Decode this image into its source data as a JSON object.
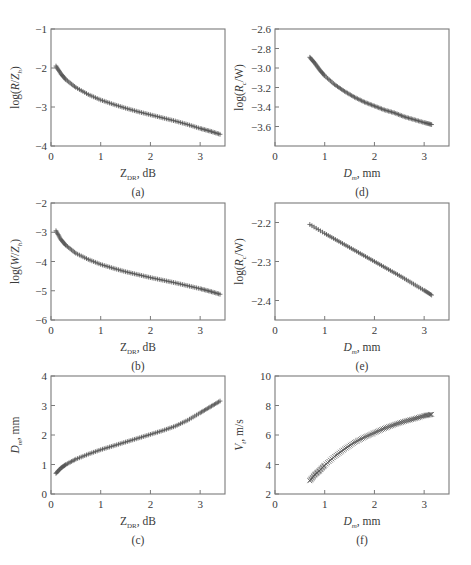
{
  "figure": {
    "panels": [
      "a",
      "b",
      "c",
      "d",
      "e",
      "f"
    ]
  },
  "chart_data": [
    {
      "id": "a",
      "type": "scatter",
      "caption": "(a)",
      "xlabel": "Z_DR, dB",
      "xlabel_main": "Z",
      "xlabel_sub": "DR",
      "xlabel_tail": ", dB",
      "ylabel": "log(R/Z_h)",
      "ylabel_parts": [
        "log(",
        "R",
        "/",
        "Z",
        "h",
        ")"
      ],
      "xlim": [
        0,
        3.5
      ],
      "ylim": [
        -4,
        -1
      ],
      "xticks": [
        0,
        1,
        2,
        3
      ],
      "yticks": [
        -1,
        -2,
        -3,
        -4
      ],
      "grid": false,
      "marker": "+",
      "frame": {
        "x": 51,
        "y": 29,
        "w": 174,
        "h": 117
      },
      "x": [
        0.1,
        0.2,
        0.3,
        0.5,
        0.75,
        1.0,
        1.25,
        1.5,
        1.75,
        2.0,
        2.25,
        2.5,
        2.75,
        3.0,
        3.2,
        3.4
      ],
      "y": [
        -1.95,
        -2.15,
        -2.3,
        -2.5,
        -2.68,
        -2.82,
        -2.93,
        -3.03,
        -3.12,
        -3.2,
        -3.28,
        -3.36,
        -3.45,
        -3.55,
        -3.62,
        -3.7
      ]
    },
    {
      "id": "b",
      "type": "scatter",
      "caption": "(b)",
      "xlabel": "Z_DR, dB",
      "xlabel_main": "Z",
      "xlabel_sub": "DR",
      "xlabel_tail": ", dB",
      "ylabel": "log(W/Z_h)",
      "ylabel_parts": [
        "log(",
        "W",
        "/",
        "Z",
        "h",
        ")"
      ],
      "xlim": [
        0,
        3.5
      ],
      "ylim": [
        -6,
        -2
      ],
      "xticks": [
        0,
        1,
        2,
        3
      ],
      "yticks": [
        -2,
        -3,
        -4,
        -5,
        -6
      ],
      "grid": false,
      "marker": "+",
      "frame": {
        "x": 51,
        "y": 203,
        "w": 174,
        "h": 117
      },
      "x": [
        0.1,
        0.2,
        0.3,
        0.5,
        0.75,
        1.0,
        1.25,
        1.5,
        1.75,
        2.0,
        2.25,
        2.5,
        2.75,
        3.0,
        3.2,
        3.4
      ],
      "y": [
        -2.95,
        -3.25,
        -3.45,
        -3.72,
        -3.93,
        -4.1,
        -4.23,
        -4.35,
        -4.45,
        -4.55,
        -4.64,
        -4.73,
        -4.83,
        -4.93,
        -5.02,
        -5.12
      ]
    },
    {
      "id": "c",
      "type": "scatter",
      "caption": "(c)",
      "xlabel": "Z_DR, dB",
      "xlabel_main": "Z",
      "xlabel_sub": "DR",
      "xlabel_tail": ", dB",
      "ylabel": "D_m, mm",
      "ylabel_parts": [
        "",
        "D",
        "",
        "",
        "m",
        ", mm"
      ],
      "xlim": [
        0,
        3.5
      ],
      "ylim": [
        0,
        4
      ],
      "xticks": [
        0,
        1,
        2,
        3
      ],
      "yticks": [
        0,
        1,
        2,
        3,
        4
      ],
      "grid": false,
      "marker": "+",
      "frame": {
        "x": 51,
        "y": 376,
        "w": 174,
        "h": 118
      },
      "x": [
        0.1,
        0.2,
        0.3,
        0.5,
        0.75,
        1.0,
        1.25,
        1.5,
        1.75,
        2.0,
        2.25,
        2.5,
        2.75,
        3.0,
        3.2,
        3.4
      ],
      "y": [
        0.7,
        0.88,
        1.0,
        1.18,
        1.35,
        1.5,
        1.63,
        1.76,
        1.89,
        2.02,
        2.15,
        2.3,
        2.5,
        2.75,
        2.95,
        3.15
      ]
    },
    {
      "id": "d",
      "type": "scatter",
      "caption": "(d)",
      "xlabel": "D_m, mm",
      "xlabel_main": "D",
      "xlabel_sub": "m",
      "xlabel_tail": ", mm",
      "ylabel": "log(R_c/W)",
      "ylabel_parts": [
        "log(",
        "R",
        "",
        "",
        "c",
        "/W)"
      ],
      "xlim": [
        0,
        3.5
      ],
      "ylim": [
        -3.8,
        -2.6
      ],
      "xticks": [
        0,
        1,
        2,
        3
      ],
      "yticks": [
        -2.6,
        -2.8,
        -3.0,
        -3.2,
        -3.4,
        -3.6
      ],
      "ytick_labels": [
        "-2.6",
        "-2.8",
        "-3.0",
        "-3.2",
        "-3.4",
        "-3.6"
      ],
      "grid": false,
      "marker": "+",
      "frame": {
        "x": 275,
        "y": 29,
        "w": 174,
        "h": 117
      },
      "x": [
        0.7,
        0.8,
        0.9,
        1.0,
        1.2,
        1.4,
        1.6,
        1.8,
        2.0,
        2.2,
        2.4,
        2.6,
        2.8,
        3.0,
        3.15
      ],
      "y": [
        -2.89,
        -2.95,
        -3.02,
        -3.08,
        -3.17,
        -3.24,
        -3.3,
        -3.35,
        -3.39,
        -3.43,
        -3.46,
        -3.5,
        -3.53,
        -3.56,
        -3.58
      ]
    },
    {
      "id": "e",
      "type": "scatter",
      "caption": "(e)",
      "xlabel": "D_m, mm",
      "xlabel_main": "D",
      "xlabel_sub": "m",
      "xlabel_tail": ", mm",
      "ylabel": "log(R_c/W)",
      "ylabel_parts": [
        "log(",
        "R",
        "",
        "",
        "c",
        "/W)"
      ],
      "xlim": [
        0,
        3.5
      ],
      "ylim": [
        -2.45,
        -2.15
      ],
      "xticks": [
        0,
        1,
        2,
        3
      ],
      "yticks": [
        -2.2,
        -2.3,
        -2.4
      ],
      "ytick_labels": [
        "-2.2",
        "-2.3",
        "-2.4"
      ],
      "grid": false,
      "marker": "+",
      "frame": {
        "x": 275,
        "y": 203,
        "w": 174,
        "h": 117
      },
      "x": [
        0.7,
        1.0,
        1.25,
        1.5,
        1.75,
        2.0,
        2.25,
        2.5,
        2.75,
        3.0,
        3.15
      ],
      "y": [
        -2.205,
        -2.228,
        -2.246,
        -2.264,
        -2.282,
        -2.3,
        -2.318,
        -2.336,
        -2.355,
        -2.374,
        -2.386
      ]
    },
    {
      "id": "f",
      "type": "scatter",
      "caption": "(f)",
      "xlabel": "D_m, mm",
      "xlabel_main": "D",
      "xlabel_sub": "m",
      "xlabel_tail": ", mm",
      "ylabel": "V_t, m/s",
      "ylabel_parts": [
        "",
        "V",
        "",
        "",
        "t",
        ", m/s"
      ],
      "xlim": [
        0,
        3.5
      ],
      "ylim": [
        2,
        10
      ],
      "xticks": [
        0,
        1,
        2,
        3
      ],
      "yticks": [
        2,
        4,
        6,
        8,
        10
      ],
      "grid": false,
      "marker": "x",
      "frame": {
        "x": 275,
        "y": 376,
        "w": 174,
        "h": 118
      },
      "x": [
        0.7,
        0.8,
        0.9,
        1.0,
        1.2,
        1.4,
        1.6,
        1.8,
        2.0,
        2.2,
        2.4,
        2.6,
        2.8,
        3.0,
        3.15
      ],
      "y": [
        2.9,
        3.3,
        3.6,
        3.95,
        4.55,
        5.05,
        5.5,
        5.85,
        6.15,
        6.45,
        6.7,
        6.92,
        7.1,
        7.3,
        7.4
      ]
    }
  ]
}
